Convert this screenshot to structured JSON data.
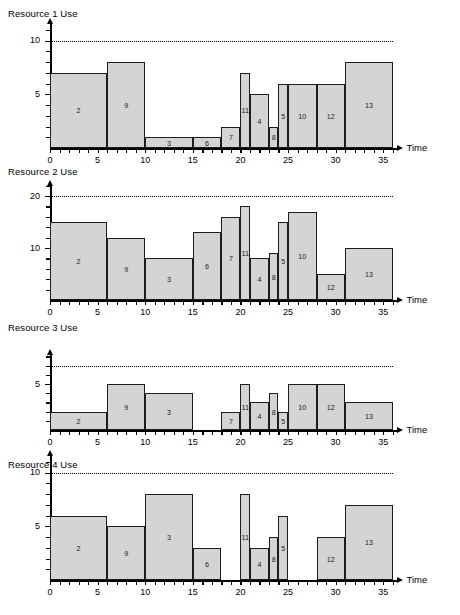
{
  "figure": {
    "x_axis_label": "Time",
    "x_ticks_labeled": [
      "0",
      "5",
      "10",
      "15",
      "20",
      "25",
      "30",
      "35"
    ]
  },
  "chart_data": [
    {
      "type": "bar",
      "title": "Resource 1 Use",
      "xlabel": "Time",
      "ylabel": "",
      "xlim": [
        0,
        36.5
      ],
      "ylim": [
        0,
        11.5
      ],
      "y_ticks_labeled": [
        5,
        10
      ],
      "y_tick_step": 1,
      "x_tick_step": 1,
      "x_ticks_labeled": [
        0,
        5,
        10,
        15,
        20,
        25,
        30,
        35
      ],
      "grid": false,
      "limit_line": 10,
      "limit_line_style": "dotted",
      "bar_fill": "#d4d4d4",
      "bar_stroke": "#1c1c1c",
      "bars": [
        {
          "label": "2",
          "start": 0,
          "end": 6,
          "value": 7
        },
        {
          "label": "9",
          "start": 6,
          "end": 10,
          "value": 8
        },
        {
          "label": "3",
          "start": 10,
          "end": 15,
          "value": 1
        },
        {
          "label": "6",
          "start": 15,
          "end": 18,
          "value": 1
        },
        {
          "label": "7",
          "start": 18,
          "end": 20,
          "value": 2
        },
        {
          "label": "11",
          "start": 20,
          "end": 21,
          "value": 7
        },
        {
          "label": "4",
          "start": 21,
          "end": 23,
          "value": 5
        },
        {
          "label": "8",
          "start": 23,
          "end": 24,
          "value": 2
        },
        {
          "label": "5",
          "start": 24,
          "end": 25,
          "value": 6
        },
        {
          "label": "10",
          "start": 25,
          "end": 28,
          "value": 6
        },
        {
          "label": "12",
          "start": 28,
          "end": 31,
          "value": 6
        },
        {
          "label": "13",
          "start": 31,
          "end": 36,
          "value": 8
        }
      ]
    },
    {
      "type": "bar",
      "title": "Resource 2 Use",
      "xlabel": "Time",
      "ylabel": "",
      "xlim": [
        0,
        36.5
      ],
      "ylim": [
        0,
        22
      ],
      "y_ticks_labeled": [
        10,
        20
      ],
      "y_tick_step": 2,
      "x_tick_step": 1,
      "x_ticks_labeled": [
        0,
        5,
        10,
        15,
        20,
        25,
        30,
        35
      ],
      "grid": false,
      "limit_line": 20,
      "limit_line_style": "dotted",
      "bar_fill": "#d4d4d4",
      "bar_stroke": "#1c1c1c",
      "bars": [
        {
          "label": "2",
          "start": 0,
          "end": 6,
          "value": 15
        },
        {
          "label": "9",
          "start": 6,
          "end": 10,
          "value": 12
        },
        {
          "label": "3",
          "start": 10,
          "end": 15,
          "value": 8
        },
        {
          "label": "6",
          "start": 15,
          "end": 18,
          "value": 13
        },
        {
          "label": "7",
          "start": 18,
          "end": 20,
          "value": 16
        },
        {
          "label": "11",
          "start": 20,
          "end": 21,
          "value": 18
        },
        {
          "label": "4",
          "start": 21,
          "end": 23,
          "value": 8
        },
        {
          "label": "8",
          "start": 23,
          "end": 24,
          "value": 9
        },
        {
          "label": "5",
          "start": 24,
          "end": 25,
          "value": 15
        },
        {
          "label": "10",
          "start": 25,
          "end": 28,
          "value": 17
        },
        {
          "label": "12",
          "start": 28,
          "end": 31,
          "value": 5
        },
        {
          "label": "13",
          "start": 31,
          "end": 36,
          "value": 10
        }
      ]
    },
    {
      "type": "bar",
      "title": "Resource 3 Use",
      "xlabel": "Time",
      "ylabel": "",
      "xlim": [
        0,
        36.5
      ],
      "ylim": [
        0,
        8.2
      ],
      "y_ticks_labeled": [
        5
      ],
      "y_tick_step": 1,
      "x_tick_step": 1,
      "x_ticks_labeled": [
        0,
        5,
        10,
        15,
        20,
        25,
        30,
        35
      ],
      "grid": false,
      "limit_line": 7,
      "limit_line_style": "dotted",
      "bar_fill": "#d4d4d4",
      "bar_stroke": "#1c1c1c",
      "bars": [
        {
          "label": "2",
          "start": 0,
          "end": 6,
          "value": 2
        },
        {
          "label": "9",
          "start": 6,
          "end": 10,
          "value": 5
        },
        {
          "label": "3",
          "start": 10,
          "end": 15,
          "value": 4
        },
        {
          "label": "7",
          "start": 18,
          "end": 20,
          "value": 2
        },
        {
          "label": "11",
          "start": 20,
          "end": 21,
          "value": 5
        },
        {
          "label": "4",
          "start": 21,
          "end": 23,
          "value": 3
        },
        {
          "label": "8",
          "start": 23,
          "end": 24,
          "value": 4
        },
        {
          "label": "5",
          "start": 24,
          "end": 25,
          "value": 2
        },
        {
          "label": "10",
          "start": 25,
          "end": 28,
          "value": 5
        },
        {
          "label": "12",
          "start": 28,
          "end": 31,
          "value": 5
        },
        {
          "label": "13",
          "start": 31,
          "end": 36,
          "value": 3
        }
      ]
    },
    {
      "type": "bar",
      "title": "Resource 4 Use",
      "xlabel": "Time",
      "ylabel": "",
      "xlim": [
        0,
        36.5
      ],
      "ylim": [
        0,
        11.5
      ],
      "y_ticks_labeled": [
        5,
        10
      ],
      "y_tick_step": 1,
      "x_tick_step": 1,
      "x_ticks_labeled": [
        0,
        5,
        10,
        15,
        20,
        25,
        30,
        35
      ],
      "grid": false,
      "limit_line": 10,
      "limit_line_style": "dotted",
      "bar_fill": "#d4d4d4",
      "bar_stroke": "#1c1c1c",
      "bars": [
        {
          "label": "2",
          "start": 0,
          "end": 6,
          "value": 6
        },
        {
          "label": "9",
          "start": 6,
          "end": 10,
          "value": 5
        },
        {
          "label": "3",
          "start": 10,
          "end": 15,
          "value": 8
        },
        {
          "label": "6",
          "start": 15,
          "end": 18,
          "value": 3
        },
        {
          "label": "11",
          "start": 20,
          "end": 21,
          "value": 8
        },
        {
          "label": "4",
          "start": 21,
          "end": 23,
          "value": 3
        },
        {
          "label": "8",
          "start": 23,
          "end": 24,
          "value": 4
        },
        {
          "label": "5",
          "start": 24,
          "end": 25,
          "value": 6
        },
        {
          "label": "12",
          "start": 28,
          "end": 31,
          "value": 4
        },
        {
          "label": "13",
          "start": 31,
          "end": 36,
          "value": 7
        }
      ]
    }
  ]
}
